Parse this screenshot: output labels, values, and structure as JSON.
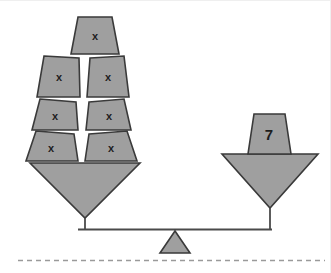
{
  "figure": {
    "type": "balance-scale-diagram",
    "colors": {
      "shape_fill": "#9f9f9f",
      "shape_stroke": "#3a3a3a",
      "beam": "#4a4a4a",
      "ground_line": "#9a9a9a",
      "label_text": "#1d1d1d",
      "background": "#ffffff"
    }
  },
  "left_pan": {
    "name": "left-pan",
    "weight_count": 7,
    "weights": [
      {
        "id": "top",
        "label": "x"
      },
      {
        "id": "left-upper",
        "label": "x"
      },
      {
        "id": "right-upper",
        "label": "x"
      },
      {
        "id": "left-mid",
        "label": "x"
      },
      {
        "id": "right-mid",
        "label": "x"
      },
      {
        "id": "left-lower",
        "label": "x"
      },
      {
        "id": "right-lower",
        "label": "x"
      }
    ]
  },
  "right_pan": {
    "name": "right-pan",
    "weight_count": 1,
    "weights": [
      {
        "id": "single",
        "label": "7"
      }
    ]
  },
  "fulcrum": {
    "name": "fulcrum-triangle"
  },
  "ground": {
    "name": "ground-dashed-line",
    "style": "dashed"
  }
}
